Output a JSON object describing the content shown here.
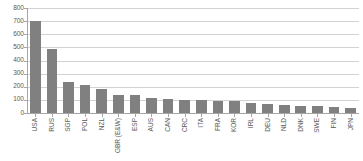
{
  "chart_data": {
    "type": "bar",
    "title": "",
    "xlabel": "",
    "ylabel": "",
    "ylim": [
      0,
      800
    ],
    "ytick_step": 100,
    "yticks": [
      800,
      700,
      600,
      500,
      400,
      300,
      200,
      100,
      0
    ],
    "grid": true,
    "legend": "none",
    "orientation": "vertical",
    "bar_color": "#808080",
    "gridline_color": "#d3d3d3",
    "axis_color": "#a6a6a6",
    "tick_label_color": "#595959",
    "categories": [
      "USA",
      "RUS",
      "SGP",
      "POL",
      "NZL",
      "GBR (E&W)",
      "ESP",
      "AUS",
      "CAN",
      "CRC",
      "ITA",
      "FRA",
      "KOR",
      "IRL",
      "DEU",
      "NLD",
      "DNK",
      "SWE",
      "FIN",
      "JPN"
    ],
    "values": [
      700,
      490,
      235,
      215,
      180,
      140,
      135,
      115,
      105,
      100,
      98,
      95,
      90,
      80,
      70,
      58,
      55,
      50,
      45,
      35
    ]
  }
}
